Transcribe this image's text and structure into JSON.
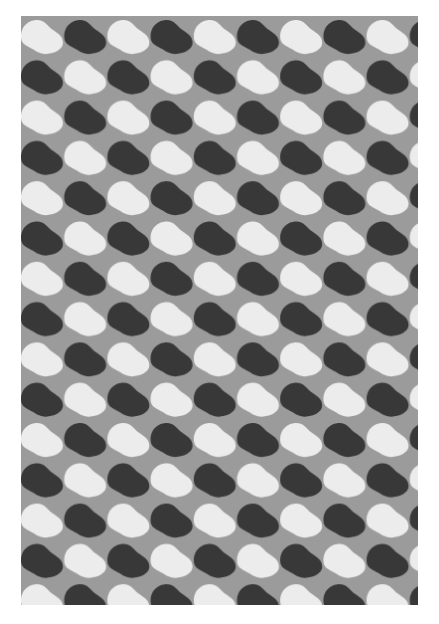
{
  "artwork": {
    "type": "geometric wave-scale tile pattern",
    "colors": {
      "background": "#9b9b9b",
      "light_shape": "#ececec",
      "dark_shape": "#383838",
      "page": "#ffffff"
    },
    "grid": {
      "columns_visible": 10,
      "rows_visible": 15,
      "cell_width": 43.2,
      "row_height": 40.3
    }
  },
  "caption": {
    "text": ""
  }
}
